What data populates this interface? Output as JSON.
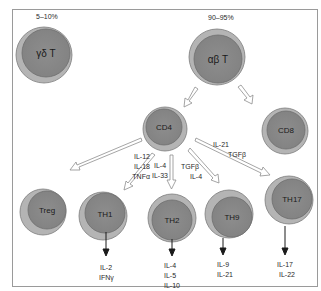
{
  "diagram": {
    "colors": {
      "frame": "#9a9a9a",
      "cell_outer": "#b4b4b4",
      "cell_inner": "#8a8a8a",
      "cell_stroke": "#6f6f6f",
      "arrow_hollow_stroke": "#8e8e8e",
      "arrow_solid": "#1a1a1a"
    },
    "percentages": {
      "gamma_delta": "5–10%",
      "alpha_beta": "90–95%"
    },
    "cells": {
      "gamma_delta": "γδ T",
      "alpha_beta": "αβ T",
      "cd4": "CD4",
      "cd8": "CD8",
      "treg": "Treg",
      "th1": "TH1",
      "th2": "TH2",
      "th9": "TH9",
      "th17": "TH17"
    },
    "inducers": {
      "th1": [
        "IL-12",
        "IL-18",
        "TNFα"
      ],
      "th2": [
        "IL-4",
        "IL-33"
      ],
      "th9": [
        "TGFβ",
        "IL-4"
      ],
      "th17": [
        "IL-21",
        "TGFβ"
      ]
    },
    "outputs": {
      "th1": [
        "IL-2",
        "IFNγ"
      ],
      "th2": [
        "IL-4",
        "IL-5",
        "IL-10"
      ],
      "th9": [
        "IL-9",
        "IL-21"
      ],
      "th17": [
        "IL-17",
        "IL-22"
      ]
    }
  }
}
